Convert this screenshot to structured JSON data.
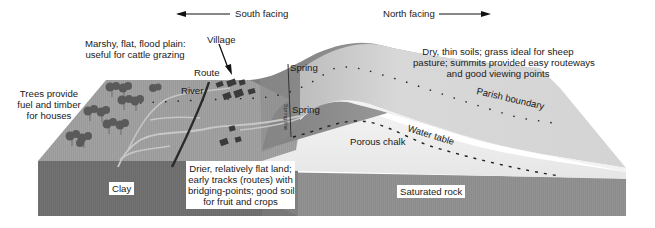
{
  "diagram": {
    "type": "block diagram of chalk escarpment settlement",
    "directions": {
      "south": "South facing",
      "north": "North facing"
    },
    "labels": {
      "village": "Village",
      "route": "Route",
      "river": "River",
      "spring_upper": "Spring",
      "spring_lower": "Spring",
      "spring_line": "Spring line",
      "parish_boundary": "Parish boundary",
      "water_table": "Water table",
      "porous_chalk": "Porous chalk",
      "clay": "Clay",
      "saturated_rock": "Saturated rock"
    },
    "annotations": {
      "marshy": [
        "Marshy, flat, flood plain:",
        "useful for cattle grazing"
      ],
      "trees": [
        "Trees provide",
        "fuel and timber",
        "for houses"
      ],
      "dry_soils": [
        "Dry, thin soils; grass ideal for sheep",
        "pasture; summits provided easy routeways",
        "and good viewing points"
      ],
      "drier_land": [
        "Drier, relatively flat land;",
        "early tracks (routes) with",
        "bridging-points; good soil",
        "for fruit and crops"
      ]
    },
    "colors": {
      "clay_face": "#6e6e6e",
      "saturated_face": "#8a8a8a",
      "vale_surface": "#9a9a9a",
      "chalk_light": "#ececec",
      "scarp_dark": "#7a7a7a",
      "dipslope": "#d2d2d2",
      "buildings": "#3a3a3a",
      "trees": "#555555"
    }
  }
}
